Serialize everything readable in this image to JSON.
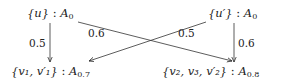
{
  "diagram": {
    "nodes": [
      {
        "id": "top-left",
        "set": "{u}",
        "sep": " : ",
        "label": "A",
        "sub": "0"
      },
      {
        "id": "top-right",
        "set": "{u′}",
        "sep": " : ",
        "label": "A",
        "sub": "0"
      },
      {
        "id": "bottom-left",
        "set": "{v₁, v′₁}",
        "sep": " : ",
        "label": "A",
        "sub": "0.7"
      },
      {
        "id": "bottom-right",
        "set": "{v₂, v₃, v′₂}",
        "sep": " : ",
        "label": "A",
        "sub": "0.8"
      }
    ],
    "edges": [
      {
        "from": "top-left",
        "to": "bottom-left",
        "weight": "0.5"
      },
      {
        "from": "top-left",
        "to": "bottom-right",
        "weight": "0.6"
      },
      {
        "from": "top-right",
        "to": "bottom-left",
        "weight": "0.5"
      },
      {
        "from": "top-right",
        "to": "bottom-right",
        "weight": "0.6"
      }
    ],
    "stroke_color": "#333333",
    "text_color": "#222222"
  }
}
